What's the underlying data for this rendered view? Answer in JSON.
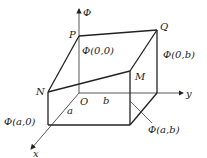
{
  "diagram": {
    "title": "",
    "axes": {
      "vertical": "Φ",
      "horizontal": "y",
      "depth": "x",
      "origin": "O"
    },
    "points": {
      "P": "P",
      "Q": "Q",
      "M": "M",
      "N": "N"
    },
    "dimensions": {
      "a": "a",
      "b": "b"
    },
    "values": {
      "phi_00": "Φ(0,0)",
      "phi_0b": "Φ(0,b)",
      "phi_a0": "Φ(a,0)",
      "phi_ab": "Φ(a,b)"
    },
    "colors": {
      "line": "#222222",
      "axis": "#555555",
      "background": "#ffffff"
    }
  }
}
